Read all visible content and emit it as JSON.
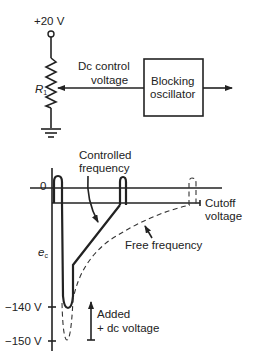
{
  "circuit": {
    "supply_label": "+20 V",
    "resistor_label": "R",
    "resistor_subscript": "1",
    "control_label_line1": "Dc control",
    "control_label_line2": "voltage",
    "box_label_line1": "Blocking",
    "box_label_line2": "oscillator"
  },
  "waveform": {
    "zero_label": "0",
    "axis_label": "e",
    "axis_subscript": "c",
    "controlled_line1": "Controlled",
    "controlled_line2": "frequency",
    "cutoff_line1": "Cutoff",
    "cutoff_line2": "voltage",
    "free_label": "Free frequency",
    "tick_140": "−140 V",
    "tick_150": "−150 V",
    "added_line1": "Added",
    "added_line2": "+ dc voltage"
  }
}
